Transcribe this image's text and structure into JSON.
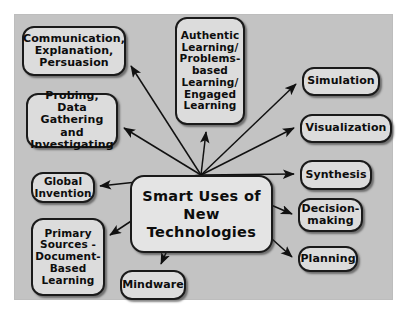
{
  "diagram": {
    "background_color": "#c3c3c3",
    "node_fill": "#dcdcdc",
    "node_border": "#1a1a1a",
    "center": {
      "label": "Smart Uses of\nNew\nTechnologies"
    },
    "nodes": [
      {
        "id": "communication",
        "label": "Communication,\nExplanation,\nPersuasion"
      },
      {
        "id": "authentic",
        "label": "Authentic\nLearning/\nProblems-\nbased\nLearning/\nEngaged\nLearning"
      },
      {
        "id": "probing",
        "label": "Probing, Data\nGathering and\nInvestigating"
      },
      {
        "id": "global",
        "label": "Global\nInvention"
      },
      {
        "id": "primary",
        "label": "Primary\nSources -\nDocument-\nBased\nLearning"
      },
      {
        "id": "mindware",
        "label": "Mindware"
      },
      {
        "id": "simulation",
        "label": "Simulation"
      },
      {
        "id": "visualization",
        "label": "Visualization"
      },
      {
        "id": "synthesis",
        "label": "Synthesis"
      },
      {
        "id": "decision",
        "label": "Decision-\nmaking"
      },
      {
        "id": "planning",
        "label": "Planning"
      }
    ],
    "edges": [
      {
        "from": "center",
        "to": "communication"
      },
      {
        "from": "center",
        "to": "authentic"
      },
      {
        "from": "center",
        "to": "probing"
      },
      {
        "from": "center",
        "to": "global"
      },
      {
        "from": "center",
        "to": "primary"
      },
      {
        "from": "center",
        "to": "mindware"
      },
      {
        "from": "center",
        "to": "simulation"
      },
      {
        "from": "center",
        "to": "visualization"
      },
      {
        "from": "center",
        "to": "synthesis"
      },
      {
        "from": "center",
        "to": "decision"
      },
      {
        "from": "center",
        "to": "planning"
      }
    ]
  }
}
